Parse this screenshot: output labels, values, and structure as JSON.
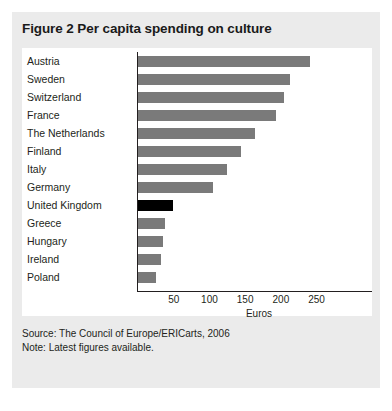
{
  "figure": {
    "title": "Figure 2 Per capita spending on culture",
    "source": "Source: The Council of Europe/ERICarts, 2006",
    "note": "Note: Latest figures available."
  },
  "colors": {
    "panel_background": "#ebebeb",
    "plot_background": "#ffffff",
    "bar": "#7a7a7a",
    "bar_highlight": "#000000",
    "axis": "#231f20",
    "text": "#231f20"
  },
  "chart_data": {
    "type": "bar",
    "orientation": "horizontal",
    "title": "Figure 2 Per capita spending on culture",
    "xlabel": "Euros",
    "ylabel": "",
    "xlim": [
      0,
      270
    ],
    "xticks": [
      50,
      100,
      150,
      200,
      250
    ],
    "grid": false,
    "legend": false,
    "highlight_category": "United Kingdom",
    "categories": [
      "Austria",
      "Sweden",
      "Switzerland",
      "France",
      "The Netherlands",
      "Finland",
      "Italy",
      "Germany",
      "United Kingdom",
      "Greece",
      "Hungary",
      "Ireland",
      "Poland"
    ],
    "values": [
      241,
      213,
      205,
      193,
      164,
      144,
      125,
      105,
      49,
      38,
      35,
      32,
      25
    ],
    "bars": [
      {
        "label": "Austria",
        "value": 241,
        "highlight": false
      },
      {
        "label": "Sweden",
        "value": 213,
        "highlight": false
      },
      {
        "label": "Switzerland",
        "value": 205,
        "highlight": false
      },
      {
        "label": "France",
        "value": 193,
        "highlight": false
      },
      {
        "label": "The Netherlands",
        "value": 164,
        "highlight": false
      },
      {
        "label": "Finland",
        "value": 144,
        "highlight": false
      },
      {
        "label": "Italy",
        "value": 125,
        "highlight": false
      },
      {
        "label": "Germany",
        "value": 105,
        "highlight": false
      },
      {
        "label": "United Kingdom",
        "value": 49,
        "highlight": true
      },
      {
        "label": "Greece",
        "value": 38,
        "highlight": false
      },
      {
        "label": "Hungary",
        "value": 35,
        "highlight": false
      },
      {
        "label": "Ireland",
        "value": 32,
        "highlight": false
      },
      {
        "label": "Poland",
        "value": 25,
        "highlight": false
      }
    ]
  }
}
